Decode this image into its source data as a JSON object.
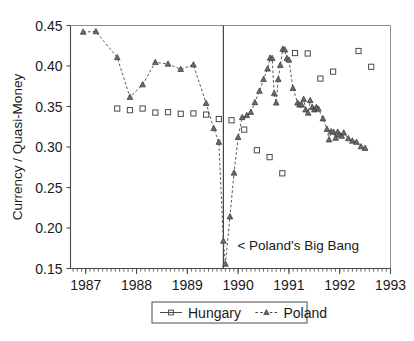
{
  "chart_data": {
    "type": "scatter",
    "title": "",
    "xlabel": "",
    "ylabel": "Currency / Quasi-Money",
    "xlim": [
      1986.7,
      1993.0
    ],
    "ylim": [
      0.15,
      0.45
    ],
    "xticks": [
      1987,
      1988,
      1989,
      1990,
      1991,
      1992,
      1993
    ],
    "xtick_labels": [
      "1987",
      "1988",
      "1989",
      "1990",
      "1991",
      "1992",
      "1993"
    ],
    "yticks": [
      0.15,
      0.2,
      0.25,
      0.3,
      0.35,
      0.4,
      0.45
    ],
    "ytick_labels": [
      "0.15",
      "0.20",
      "0.25",
      "0.30",
      "0.35",
      "0.40",
      "0.45"
    ],
    "minor_xtick_interval": 0.0833,
    "grid": false,
    "legend_position": "bottom-center",
    "annotations": [
      {
        "name": "polands-big-bang",
        "text": "< Poland's Big Bang",
        "x": 1989.75,
        "y": 0.178,
        "marker": "vertical-line"
      }
    ],
    "event_line_x": 1989.71,
    "series": [
      {
        "name": "Hungary",
        "marker": "square",
        "line_style": "none",
        "color": "#4a4a4a",
        "points": [
          {
            "x": 1987.62,
            "y": 0.3475
          },
          {
            "x": 1987.87,
            "y": 0.3455
          },
          {
            "x": 1988.12,
            "y": 0.3475
          },
          {
            "x": 1988.37,
            "y": 0.3425
          },
          {
            "x": 1988.62,
            "y": 0.343
          },
          {
            "x": 1988.87,
            "y": 0.341
          },
          {
            "x": 1989.12,
            "y": 0.3415
          },
          {
            "x": 1989.37,
            "y": 0.34
          },
          {
            "x": 1989.62,
            "y": 0.3345
          },
          {
            "x": 1989.87,
            "y": 0.333
          },
          {
            "x": 1990.12,
            "y": 0.3215
          },
          {
            "x": 1990.37,
            "y": 0.296
          },
          {
            "x": 1990.62,
            "y": 0.2875
          },
          {
            "x": 1990.87,
            "y": 0.2675
          },
          {
            "x": 1991.12,
            "y": 0.416
          },
          {
            "x": 1991.37,
            "y": 0.4155
          },
          {
            "x": 1991.62,
            "y": 0.3845
          },
          {
            "x": 1991.87,
            "y": 0.393
          },
          {
            "x": 1992.37,
            "y": 0.4185
          },
          {
            "x": 1992.62,
            "y": 0.399
          }
        ]
      },
      {
        "name": "Poland",
        "marker": "triangle",
        "line_style": "dashed",
        "color": "#555555",
        "points": [
          {
            "x": 1986.95,
            "y": 0.442
          },
          {
            "x": 1987.2,
            "y": 0.4425
          },
          {
            "x": 1987.62,
            "y": 0.4105
          },
          {
            "x": 1987.87,
            "y": 0.3615
          },
          {
            "x": 1988.12,
            "y": 0.377
          },
          {
            "x": 1988.37,
            "y": 0.4045
          },
          {
            "x": 1988.62,
            "y": 0.4025
          },
          {
            "x": 1988.87,
            "y": 0.396
          },
          {
            "x": 1989.12,
            "y": 0.4015
          },
          {
            "x": 1989.37,
            "y": 0.354
          },
          {
            "x": 1989.52,
            "y": 0.323
          },
          {
            "x": 1989.62,
            "y": 0.306
          },
          {
            "x": 1989.71,
            "y": 0.184
          },
          {
            "x": 1989.75,
            "y": 0.1555
          },
          {
            "x": 1989.84,
            "y": 0.214
          },
          {
            "x": 1989.92,
            "y": 0.268
          },
          {
            "x": 1990.0,
            "y": 0.312
          },
          {
            "x": 1990.08,
            "y": 0.3365
          },
          {
            "x": 1990.17,
            "y": 0.339
          },
          {
            "x": 1990.25,
            "y": 0.343
          },
          {
            "x": 1990.33,
            "y": 0.355
          },
          {
            "x": 1990.42,
            "y": 0.369
          },
          {
            "x": 1990.5,
            "y": 0.3835
          },
          {
            "x": 1990.58,
            "y": 0.3965
          },
          {
            "x": 1990.63,
            "y": 0.41
          },
          {
            "x": 1990.67,
            "y": 0.4095
          },
          {
            "x": 1990.71,
            "y": 0.366
          },
          {
            "x": 1990.75,
            "y": 0.3545
          },
          {
            "x": 1990.79,
            "y": 0.3835
          },
          {
            "x": 1990.83,
            "y": 0.401
          },
          {
            "x": 1990.88,
            "y": 0.421
          },
          {
            "x": 1990.92,
            "y": 0.42
          },
          {
            "x": 1990.96,
            "y": 0.4095
          },
          {
            "x": 1991.0,
            "y": 0.4075
          },
          {
            "x": 1991.08,
            "y": 0.3725
          },
          {
            "x": 1991.17,
            "y": 0.3545
          },
          {
            "x": 1991.21,
            "y": 0.352
          },
          {
            "x": 1991.25,
            "y": 0.352
          },
          {
            "x": 1991.29,
            "y": 0.359
          },
          {
            "x": 1991.33,
            "y": 0.346
          },
          {
            "x": 1991.38,
            "y": 0.342
          },
          {
            "x": 1991.42,
            "y": 0.3575
          },
          {
            "x": 1991.46,
            "y": 0.349
          },
          {
            "x": 1991.5,
            "y": 0.346
          },
          {
            "x": 1991.54,
            "y": 0.349
          },
          {
            "x": 1991.58,
            "y": 0.347
          },
          {
            "x": 1991.67,
            "y": 0.335
          },
          {
            "x": 1991.75,
            "y": 0.322
          },
          {
            "x": 1991.79,
            "y": 0.309
          },
          {
            "x": 1991.83,
            "y": 0.319
          },
          {
            "x": 1991.88,
            "y": 0.3185
          },
          {
            "x": 1991.92,
            "y": 0.311
          },
          {
            "x": 1991.96,
            "y": 0.3185
          },
          {
            "x": 1992.0,
            "y": 0.315
          },
          {
            "x": 1992.04,
            "y": 0.3135
          },
          {
            "x": 1992.08,
            "y": 0.3175
          },
          {
            "x": 1992.17,
            "y": 0.3105
          },
          {
            "x": 1992.25,
            "y": 0.3075
          },
          {
            "x": 1992.33,
            "y": 0.306
          },
          {
            "x": 1992.42,
            "y": 0.3005
          },
          {
            "x": 1992.5,
            "y": 0.2985
          }
        ]
      }
    ]
  },
  "legend": {
    "entries": [
      {
        "label": "Hungary",
        "marker": "square",
        "line_style": "solid"
      },
      {
        "label": "Poland",
        "marker": "triangle",
        "line_style": "dashed"
      }
    ]
  }
}
